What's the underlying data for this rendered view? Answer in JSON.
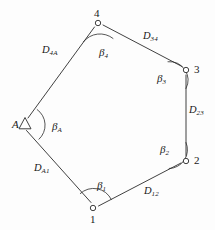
{
  "figure": {
    "name": "closed-traverse-survey-diagram",
    "type": "diagram",
    "background_color": "#fdfdfd",
    "line_color": "#2b2b2b",
    "text_color": "#181818",
    "width": 215,
    "height": 230
  },
  "points": [
    {
      "id": "A",
      "label": "A",
      "marker": "triangle",
      "x": 25,
      "y": 124,
      "label_x": 12,
      "label_y": 119
    },
    {
      "id": "1",
      "label": "1",
      "marker": "circle",
      "x": 93,
      "y": 208,
      "label_x": 90,
      "label_y": 214
    },
    {
      "id": "2",
      "label": "2",
      "marker": "circle",
      "x": 186,
      "y": 161,
      "label_x": 194,
      "label_y": 155
    },
    {
      "id": "3",
      "label": "3",
      "marker": "circle",
      "x": 186,
      "y": 70,
      "label_x": 194,
      "label_y": 64
    },
    {
      "id": "4",
      "label": "4",
      "marker": "circle",
      "x": 98,
      "y": 23,
      "label_x": 94,
      "label_y": 8
    }
  ],
  "sides": [
    {
      "id": "DA1",
      "from": "A",
      "to": "1",
      "base": "D",
      "sub": "A1",
      "label_x": 34,
      "label_y": 163
    },
    {
      "id": "D12",
      "from": "1",
      "to": "2",
      "base": "D",
      "sub": "12",
      "label_x": 144,
      "label_y": 186
    },
    {
      "id": "D23",
      "from": "2",
      "to": "3",
      "base": "D",
      "sub": "23",
      "label_x": 189,
      "label_y": 105
    },
    {
      "id": "D34",
      "from": "3",
      "to": "4",
      "base": "D",
      "sub": "34",
      "label_x": 143,
      "label_y": 31
    },
    {
      "id": "D4A",
      "from": "4",
      "to": "A",
      "base": "D",
      "sub": "4A",
      "label_x": 42,
      "label_y": 45
    }
  ],
  "angles": [
    {
      "id": "betaA",
      "at": "A",
      "base": "β",
      "sub": "A",
      "label_x": 52,
      "label_y": 121
    },
    {
      "id": "beta1",
      "at": "1",
      "base": "β",
      "sub": "1",
      "label_x": 97,
      "label_y": 180
    },
    {
      "id": "beta2",
      "at": "2",
      "base": "β",
      "sub": "2",
      "label_x": 160,
      "label_y": 144
    },
    {
      "id": "beta3",
      "at": "3",
      "base": "β",
      "sub": "3",
      "label_x": 157,
      "label_y": 73
    },
    {
      "id": "beta4",
      "at": "4",
      "base": "β",
      "sub": "4",
      "label_x": 99,
      "label_y": 47
    }
  ]
}
